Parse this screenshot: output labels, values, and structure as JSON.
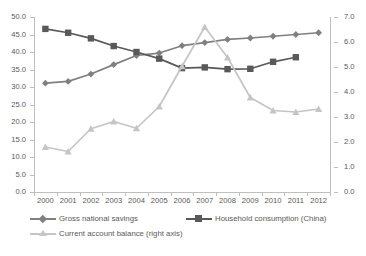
{
  "chart_data": {
    "type": "line",
    "title": "",
    "xlabel": "",
    "ylabel": "",
    "categories": [
      "2000",
      "2001",
      "2002",
      "2003",
      "2004",
      "2005",
      "2006",
      "2007",
      "2008",
      "2009",
      "2010",
      "2011",
      "2012"
    ],
    "left_axis": {
      "min": 0.0,
      "max": 50.0,
      "step": 5.0,
      "ticks": [
        "0.0",
        "5.0",
        "10.0",
        "15.0",
        "20.0",
        "25.0",
        "30.0",
        "35.0",
        "40.0",
        "45.0",
        "50.0"
      ]
    },
    "right_axis": {
      "min": 0.0,
      "max": 7.0,
      "step": 1.0,
      "ticks": [
        "0.0",
        "1.0",
        "2.0",
        "3.0",
        "4.0",
        "5.0",
        "6.0",
        "7.0"
      ]
    },
    "grid": false,
    "legend_position": "bottom",
    "series": [
      {
        "name": "Gross national savings",
        "axis": "left",
        "color": "#808080",
        "marker": "diamond",
        "values": [
          31.1,
          31.6,
          33.7,
          36.4,
          39.0,
          39.7,
          41.8,
          42.7,
          43.6,
          44.0,
          44.5,
          45.0,
          45.5
        ]
      },
      {
        "name": "Household consumption (China)",
        "axis": "left",
        "color": "#595959",
        "marker": "square",
        "values": [
          46.6,
          45.5,
          43.9,
          41.7,
          40.0,
          38.1,
          35.4,
          35.6,
          35.1,
          35.2,
          37.2,
          38.5,
          null
        ]
      },
      {
        "name": "Current account balance (right axis)",
        "axis": "right",
        "color": "#c5c5c5",
        "marker": "triangle",
        "values": [
          1.8,
          1.62,
          2.53,
          2.82,
          2.55,
          3.42,
          5.03,
          6.6,
          5.38,
          3.78,
          3.26,
          3.2,
          3.32
        ]
      }
    ]
  },
  "legend": {
    "items": [
      {
        "label": "Gross national savings"
      },
      {
        "label": "Household consumption (China)"
      },
      {
        "label": "Current account balance (right axis)"
      }
    ]
  }
}
